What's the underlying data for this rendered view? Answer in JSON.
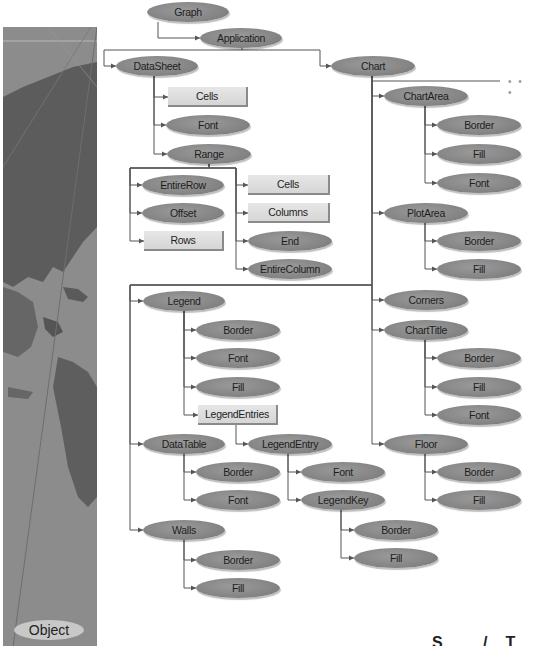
{
  "diagram": {
    "sidebar_label": "Object",
    "more_indicator": "• • •",
    "corner_text": "S /T",
    "colors": {
      "object_fill": "#858585",
      "collection_fill": "#dcdcdc",
      "connector": "#555555",
      "sidebar": "#8a8a8a"
    },
    "legend_kinds": {
      "obj": "Object (oval)",
      "coll": "Object and collection (rectangle)"
    },
    "nodes": [
      {
        "id": "graph",
        "label": "Graph",
        "kind": "obj",
        "x": 147,
        "y": 2,
        "w": 82
      },
      {
        "id": "application",
        "label": "Application",
        "kind": "obj",
        "x": 200,
        "y": 28,
        "w": 82
      },
      {
        "id": "datasheet",
        "label": "DataSheet",
        "kind": "obj",
        "x": 116,
        "y": 56,
        "w": 82
      },
      {
        "id": "ds-cells",
        "label": "Cells",
        "kind": "coll",
        "x": 168,
        "y": 87,
        "w": 80
      },
      {
        "id": "ds-font",
        "label": "Font",
        "kind": "obj",
        "x": 166,
        "y": 115,
        "w": 84
      },
      {
        "id": "range",
        "label": "Range",
        "kind": "obj",
        "x": 167,
        "y": 144,
        "w": 84
      },
      {
        "id": "entirerow",
        "label": "EntireRow",
        "kind": "obj",
        "x": 142,
        "y": 175,
        "w": 82
      },
      {
        "id": "offset",
        "label": "Offset",
        "kind": "obj",
        "x": 142,
        "y": 203,
        "w": 82
      },
      {
        "id": "rows",
        "label": "Rows",
        "kind": "coll",
        "x": 144,
        "y": 231,
        "w": 80
      },
      {
        "id": "r-cells",
        "label": "Cells",
        "kind": "coll",
        "x": 248,
        "y": 175,
        "w": 82
      },
      {
        "id": "columns",
        "label": "Columns",
        "kind": "coll",
        "x": 248,
        "y": 203,
        "w": 82
      },
      {
        "id": "end",
        "label": "End",
        "kind": "obj",
        "x": 248,
        "y": 231,
        "w": 84
      },
      {
        "id": "entirecolumn",
        "label": "EntireColumn",
        "kind": "obj",
        "x": 248,
        "y": 259,
        "w": 84
      },
      {
        "id": "chart",
        "label": "Chart",
        "kind": "obj",
        "x": 331,
        "y": 56,
        "w": 84
      },
      {
        "id": "chartarea",
        "label": "ChartArea",
        "kind": "obj",
        "x": 384,
        "y": 86,
        "w": 84
      },
      {
        "id": "ca-border",
        "label": "Border",
        "kind": "obj",
        "x": 437,
        "y": 115,
        "w": 84
      },
      {
        "id": "ca-fill",
        "label": "Fill",
        "kind": "obj",
        "x": 437,
        "y": 144,
        "w": 84
      },
      {
        "id": "ca-font",
        "label": "Font",
        "kind": "obj",
        "x": 437,
        "y": 173,
        "w": 84
      },
      {
        "id": "plotarea",
        "label": "PlotArea",
        "kind": "obj",
        "x": 384,
        "y": 203,
        "w": 84
      },
      {
        "id": "pa-border",
        "label": "Border",
        "kind": "obj",
        "x": 437,
        "y": 231,
        "w": 84
      },
      {
        "id": "pa-fill",
        "label": "Fill",
        "kind": "obj",
        "x": 437,
        "y": 259,
        "w": 84
      },
      {
        "id": "corners",
        "label": "Corners",
        "kind": "obj",
        "x": 384,
        "y": 290,
        "w": 84
      },
      {
        "id": "charttitle",
        "label": "ChartTitle",
        "kind": "obj",
        "x": 384,
        "y": 320,
        "w": 84
      },
      {
        "id": "ct-border",
        "label": "Border",
        "kind": "obj",
        "x": 437,
        "y": 348,
        "w": 84
      },
      {
        "id": "ct-fill",
        "label": "Fill",
        "kind": "obj",
        "x": 437,
        "y": 377,
        "w": 84
      },
      {
        "id": "ct-font",
        "label": "Font",
        "kind": "obj",
        "x": 437,
        "y": 405,
        "w": 84
      },
      {
        "id": "floor",
        "label": "Floor",
        "kind": "obj",
        "x": 384,
        "y": 434,
        "w": 84
      },
      {
        "id": "fl-border",
        "label": "Border",
        "kind": "obj",
        "x": 437,
        "y": 462,
        "w": 84
      },
      {
        "id": "fl-fill",
        "label": "Fill",
        "kind": "obj",
        "x": 437,
        "y": 490,
        "w": 84
      },
      {
        "id": "legend",
        "label": "Legend",
        "kind": "obj",
        "x": 143,
        "y": 291,
        "w": 82
      },
      {
        "id": "lg-border",
        "label": "Border",
        "kind": "obj",
        "x": 196,
        "y": 320,
        "w": 84
      },
      {
        "id": "lg-font",
        "label": "Font",
        "kind": "obj",
        "x": 196,
        "y": 348,
        "w": 84
      },
      {
        "id": "lg-fill",
        "label": "Fill",
        "kind": "obj",
        "x": 196,
        "y": 377,
        "w": 84
      },
      {
        "id": "legendentries",
        "label": "LegendEntries",
        "kind": "coll",
        "x": 198,
        "y": 405,
        "w": 80
      },
      {
        "id": "datatable",
        "label": "DataTable",
        "kind": "obj",
        "x": 143,
        "y": 434,
        "w": 82
      },
      {
        "id": "dt-border",
        "label": "Border",
        "kind": "obj",
        "x": 196,
        "y": 462,
        "w": 84
      },
      {
        "id": "dt-font",
        "label": "Font",
        "kind": "obj",
        "x": 196,
        "y": 490,
        "w": 84
      },
      {
        "id": "legendentry",
        "label": "LegendEntry",
        "kind": "obj",
        "x": 248,
        "y": 434,
        "w": 84
      },
      {
        "id": "le-font",
        "label": "Font",
        "kind": "obj",
        "x": 301,
        "y": 462,
        "w": 84
      },
      {
        "id": "legendkey",
        "label": "LegendKey",
        "kind": "obj",
        "x": 301,
        "y": 490,
        "w": 84
      },
      {
        "id": "lk-border",
        "label": "Border",
        "kind": "obj",
        "x": 354,
        "y": 520,
        "w": 84
      },
      {
        "id": "lk-fill",
        "label": "Fill",
        "kind": "obj",
        "x": 354,
        "y": 548,
        "w": 84
      },
      {
        "id": "walls",
        "label": "Walls",
        "kind": "obj",
        "x": 143,
        "y": 520,
        "w": 82
      },
      {
        "id": "wl-border",
        "label": "Border",
        "kind": "obj",
        "x": 196,
        "y": 550,
        "w": 84
      },
      {
        "id": "wl-fill",
        "label": "Fill",
        "kind": "obj",
        "x": 196,
        "y": 578,
        "w": 84
      }
    ],
    "edges": [
      [
        "graph",
        "application"
      ],
      [
        "application",
        "datasheet"
      ],
      [
        "application",
        "chart"
      ],
      [
        "datasheet",
        "ds-cells"
      ],
      [
        "datasheet",
        "ds-font"
      ],
      [
        "datasheet",
        "range"
      ],
      [
        "range",
        "entirerow"
      ],
      [
        "range",
        "offset"
      ],
      [
        "range",
        "rows"
      ],
      [
        "range",
        "r-cells"
      ],
      [
        "range",
        "columns"
      ],
      [
        "range",
        "end"
      ],
      [
        "range",
        "entirecolumn"
      ],
      [
        "chart",
        "chartarea"
      ],
      [
        "chartarea",
        "ca-border"
      ],
      [
        "chartarea",
        "ca-fill"
      ],
      [
        "chartarea",
        "ca-font"
      ],
      [
        "chart",
        "plotarea"
      ],
      [
        "plotarea",
        "pa-border"
      ],
      [
        "plotarea",
        "pa-fill"
      ],
      [
        "chart",
        "corners"
      ],
      [
        "chart",
        "charttitle"
      ],
      [
        "charttitle",
        "ct-border"
      ],
      [
        "charttitle",
        "ct-fill"
      ],
      [
        "charttitle",
        "ct-font"
      ],
      [
        "chart",
        "floor"
      ],
      [
        "floor",
        "fl-border"
      ],
      [
        "floor",
        "fl-fill"
      ],
      [
        "chart",
        "legend"
      ],
      [
        "legend",
        "lg-border"
      ],
      [
        "legend",
        "lg-font"
      ],
      [
        "legend",
        "lg-fill"
      ],
      [
        "legend",
        "legendentries"
      ],
      [
        "legendentries",
        "legendentry"
      ],
      [
        "legendentry",
        "le-font"
      ],
      [
        "legendentry",
        "legendkey"
      ],
      [
        "legendkey",
        "lk-border"
      ],
      [
        "legendkey",
        "lk-fill"
      ],
      [
        "chart",
        "datatable"
      ],
      [
        "datatable",
        "dt-border"
      ],
      [
        "datatable",
        "dt-font"
      ],
      [
        "chart",
        "walls"
      ],
      [
        "walls",
        "wl-border"
      ],
      [
        "walls",
        "wl-fill"
      ]
    ]
  }
}
